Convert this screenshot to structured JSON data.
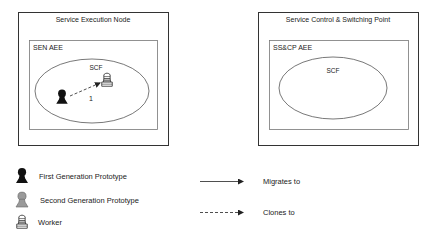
{
  "diagram": {
    "nodes": [
      {
        "title": "Service Execution Node",
        "aee_label": "SEN AEE",
        "scf_label": "SCF",
        "contents": [
          "first-generation-prototype",
          "worker"
        ],
        "relations": [
          {
            "from": "first-generation-prototype",
            "to": "worker",
            "type": "clones-to",
            "step_label": "1"
          }
        ]
      },
      {
        "title": "Service Control & Switching Point",
        "aee_label": "SS&CP AEE",
        "scf_label": "SCF",
        "contents": []
      }
    ],
    "legend": {
      "icons": [
        {
          "icon": "first-generation-prototype-icon",
          "label": "First Generation Prototype",
          "color": "#111111"
        },
        {
          "icon": "second-generation-prototype-icon",
          "label": "Second Generation Prototype",
          "color": "#9a9a9a"
        },
        {
          "icon": "worker-icon",
          "label": "Worker",
          "color": "#ffffff"
        }
      ],
      "arrows": [
        {
          "style": "solid",
          "label": "Migrates to"
        },
        {
          "style": "dashed",
          "label": "Clones to"
        }
      ]
    }
  }
}
